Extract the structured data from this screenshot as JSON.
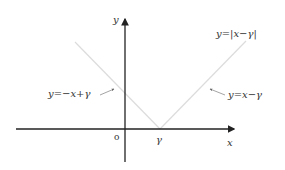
{
  "diagram": {
    "axes": {
      "x_label": "x",
      "y_label": "y",
      "origin_label": "o",
      "vertex_label": "γ"
    },
    "lines": {
      "left": {
        "label": "y=−x+γ",
        "color": "#d9d9d9"
      },
      "right": {
        "label": "y=x−γ",
        "color": "#d9d9d9"
      }
    },
    "function_label": "y=|x−γ|",
    "colors": {
      "axis": "#222222",
      "graph": "#dcdcdc",
      "text": "#333333",
      "pointer": "#555555"
    }
  }
}
